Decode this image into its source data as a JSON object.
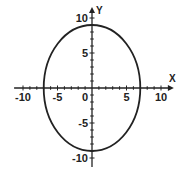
{
  "chart_data": {
    "type": "line",
    "title": "",
    "xlabel": "X",
    "ylabel": "Y",
    "xlim": [
      -11,
      11
    ],
    "ylim": [
      -11,
      11
    ],
    "grid": false,
    "x_ticks": [
      -10,
      -5,
      0,
      5,
      10
    ],
    "y_ticks": [
      -10,
      -5,
      5,
      10
    ],
    "x_tick_labels": [
      "-10",
      "-5",
      "0",
      "5",
      "10"
    ],
    "y_tick_labels": [
      "-10",
      "-5",
      "5",
      "10"
    ],
    "minor_tick_step": 1,
    "series": [
      {
        "name": "ellipse",
        "shape": "ellipse",
        "center": [
          0,
          0
        ],
        "semi_axis_x": 7,
        "semi_axis_y": 9,
        "equation": "x^2/49 + y^2/81 = 1",
        "color": "#222222"
      }
    ]
  },
  "layout": {
    "origin_px": [
      92,
      88
    ],
    "px_per_unit_x": 6.9,
    "px_per_unit_y": 7.0,
    "axis_color": "#222222"
  }
}
